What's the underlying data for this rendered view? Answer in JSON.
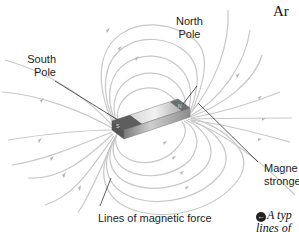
{
  "figure": {
    "heading_fragment": "Ar",
    "labels": {
      "north_pole": [
        "North",
        "Pole"
      ],
      "south_pole": [
        "South",
        "Pole"
      ],
      "field_strength": [
        "Magne",
        "stronge"
      ],
      "field_lines": "Lines of magnetic force"
    },
    "caption": {
      "icon": "arrow-left-circle-icon",
      "icon_glyph": "←",
      "line1": "A typ",
      "line2": "lines of"
    },
    "colors": {
      "field_line": "#c8c8c8",
      "leader_line": "#333333",
      "magnet_light": "#e4e4e4",
      "magnet_dark": "#6a6a6a",
      "text": "#222222"
    }
  }
}
